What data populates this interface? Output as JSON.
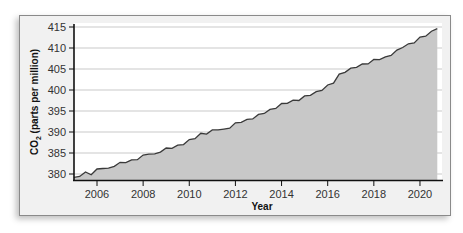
{
  "chart_data": {
    "type": "area",
    "title": "",
    "xlabel": "Year",
    "ylabel": "CO2 (parts per million)",
    "ylabel_main": "CO",
    "ylabel_sub": "2",
    "ylabel_rest": " (parts per million)",
    "xlim": [
      2005.0,
      2020.8
    ],
    "ylim": [
      380,
      415
    ],
    "grid": {
      "horizontal": true,
      "vertical": false
    },
    "legend": null,
    "x_ticks": [
      "2006",
      "2008",
      "2010",
      "2012",
      "2014",
      "2016",
      "2018",
      "2020"
    ],
    "y_ticks": [
      "380",
      "385",
      "390",
      "395",
      "400",
      "405",
      "410",
      "415"
    ],
    "colors": {
      "fill": "#c8c8c8",
      "line": "#3a3a3a",
      "grid": "#c9c9c9",
      "frame_bg": "#f1f1f1",
      "plot_bg": "#ffffff"
    },
    "series": [
      {
        "name": "Atmospheric CO2",
        "x": [
          2005.0,
          2005.25,
          2005.5,
          2005.75,
          2006.0,
          2006.25,
          2006.5,
          2006.75,
          2007.0,
          2007.25,
          2007.5,
          2007.75,
          2008.0,
          2008.25,
          2008.5,
          2008.75,
          2009.0,
          2009.25,
          2009.5,
          2009.75,
          2010.0,
          2010.25,
          2010.5,
          2010.75,
          2011.0,
          2011.25,
          2011.5,
          2011.75,
          2012.0,
          2012.25,
          2012.5,
          2012.75,
          2013.0,
          2013.25,
          2013.5,
          2013.75,
          2014.0,
          2014.25,
          2014.5,
          2014.75,
          2015.0,
          2015.25,
          2015.5,
          2015.75,
          2016.0,
          2016.25,
          2016.5,
          2016.75,
          2017.0,
          2017.25,
          2017.5,
          2017.75,
          2018.0,
          2018.25,
          2018.5,
          2018.75,
          2019.0,
          2019.25,
          2019.5,
          2019.75,
          2020.0,
          2020.25,
          2020.5,
          2020.75
        ],
        "values": [
          379.0,
          379.6,
          380.3,
          380.0,
          381.0,
          381.5,
          381.2,
          382.0,
          382.6,
          382.9,
          383.2,
          383.6,
          384.3,
          384.9,
          384.6,
          385.4,
          386.0,
          386.3,
          386.7,
          387.2,
          388.0,
          388.6,
          389.5,
          389.7,
          390.3,
          390.7,
          390.5,
          391.1,
          392.0,
          392.5,
          392.8,
          393.3,
          394.0,
          394.6,
          395.2,
          395.8,
          396.6,
          397.0,
          397.4,
          397.7,
          398.4,
          398.9,
          399.4,
          400.1,
          401.0,
          401.8,
          403.6,
          404.4,
          405.0,
          405.6,
          406.0,
          406.4,
          407.1,
          407.4,
          407.7,
          408.4,
          409.3,
          410.3,
          410.8,
          411.4,
          412.4,
          413.0,
          413.8,
          414.8
        ]
      }
    ]
  }
}
